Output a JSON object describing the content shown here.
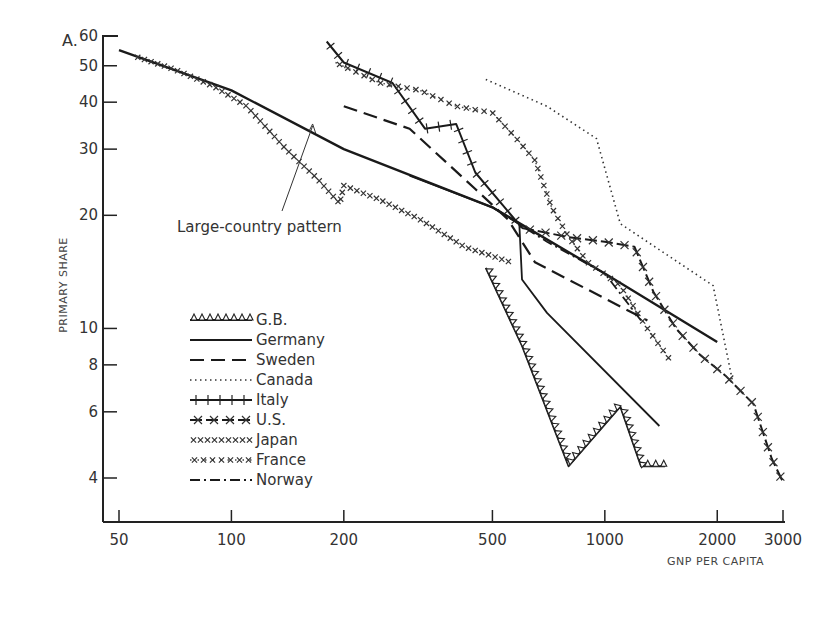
{
  "chart_data": {
    "type": "line",
    "panel_label": "A.",
    "title": "",
    "xlabel": "GNP PER CAPITA",
    "ylabel": "PRIMARY SHARE",
    "xscale": "log",
    "yscale": "log",
    "xlim": [
      45,
      3100
    ],
    "ylim": [
      3.3,
      60
    ],
    "x_ticks": [
      50,
      100,
      200,
      500,
      1000,
      2000,
      3000
    ],
    "y_ticks": [
      4,
      6,
      8,
      10,
      20,
      30,
      40,
      50,
      60
    ],
    "grid": false,
    "legend_position": "lower-left inside",
    "annotations": [
      {
        "text": "Large-country pattern",
        "arrow_to": [
          165,
          35
        ]
      }
    ],
    "series": [
      {
        "name": "Large-country pattern",
        "style": "solid-thick",
        "x": [
          50,
          100,
          200,
          500,
          1000,
          2000
        ],
        "y": [
          55,
          43,
          30,
          21,
          14,
          9.2
        ]
      },
      {
        "name": "G.B.",
        "style": "triangles",
        "x": [
          480,
          600,
          800,
          1100,
          1250,
          1450
        ],
        "y": [
          14.5,
          9,
          4.3,
          6.2,
          4.3,
          4.3
        ]
      },
      {
        "name": "Germany",
        "style": "solid",
        "x": [
          300,
          500,
          590,
          600,
          700,
          1400
        ],
        "y": [
          25.5,
          21,
          19,
          13.5,
          11,
          5.5
        ]
      },
      {
        "name": "Sweden",
        "style": "dashed",
        "x": [
          200,
          300,
          450,
          550,
          650,
          1300
        ],
        "y": [
          39,
          34,
          23.5,
          19.5,
          15,
          10.5
        ]
      },
      {
        "name": "Canada",
        "style": "dotted",
        "x": [
          480,
          700,
          950,
          1100,
          1950,
          2200
        ],
        "y": [
          46,
          39,
          32,
          19,
          13,
          7.2
        ]
      },
      {
        "name": "Italy",
        "style": "solid-ticks",
        "x": [
          180,
          200,
          270,
          330,
          400,
          450,
          600
        ],
        "y": [
          58,
          51,
          45,
          34,
          35,
          26,
          18.5
        ]
      },
      {
        "name": "U.S.",
        "style": "dash-x",
        "x": [
          600,
          800,
          1000,
          1200,
          1350,
          1550,
          1800,
          2100,
          2500,
          2800,
          3000
        ],
        "y": [
          18.5,
          17.5,
          17,
          16.5,
          12.5,
          10,
          8.5,
          7.5,
          6.3,
          4.5,
          3.9
        ]
      },
      {
        "name": "Japan",
        "style": "dense-x",
        "x": [
          55,
          70,
          90,
          110,
          140,
          170,
          195,
          200,
          250,
          320,
          420,
          560
        ],
        "y": [
          53,
          49,
          44,
          39,
          30,
          25,
          21.5,
          24,
          22,
          19.5,
          16.5,
          15
        ]
      },
      {
        "name": "France",
        "style": "dot-x",
        "x": [
          190,
          250,
          320,
          400,
          500,
          580,
          650,
          720,
          800,
          900,
          1100,
          1300,
          1500
        ],
        "y": [
          51,
          45,
          43,
          39,
          37.5,
          32,
          28,
          21,
          17.5,
          15,
          13,
          10,
          8.2
        ]
      },
      {
        "name": "Norway",
        "style": "dash-dot",
        "x": [
          500,
          700,
          1000,
          1250
        ],
        "y": [
          21,
          17,
          14,
          10.5
        ]
      }
    ]
  },
  "legend": {
    "items": [
      {
        "label": "G.B."
      },
      {
        "label": "Germany"
      },
      {
        "label": "Sweden"
      },
      {
        "label": "Canada"
      },
      {
        "label": "Italy"
      },
      {
        "label": "U.S."
      },
      {
        "label": "Japan"
      },
      {
        "label": "France"
      },
      {
        "label": "Norway"
      }
    ]
  }
}
